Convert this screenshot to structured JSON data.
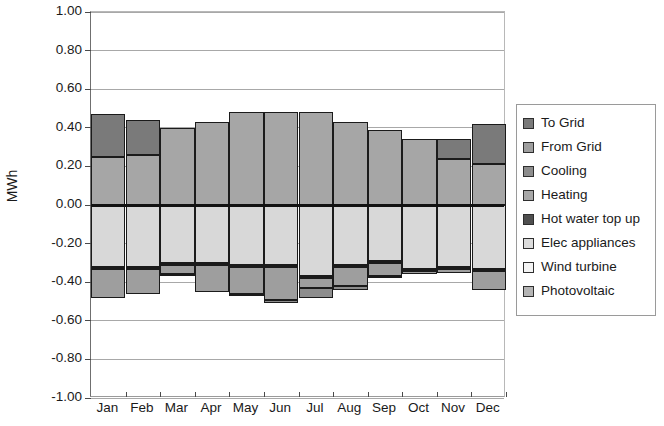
{
  "chart_data": {
    "type": "bar",
    "stacked": true,
    "title": "",
    "xlabel": "",
    "ylabel": "MWh",
    "ylim": [
      -1.0,
      1.0
    ],
    "ytick_step": 0.2,
    "grid": true,
    "legend_position": "right",
    "categories": [
      "Jan",
      "Feb",
      "Mar",
      "Apr",
      "May",
      "Jun",
      "Jul",
      "Aug",
      "Sep",
      "Oct",
      "Nov",
      "Dec"
    ],
    "ytick_labels": [
      "1.00",
      "0.80",
      "0.60",
      "0.40",
      "0.20",
      "0.00",
      "-0.20",
      "-0.40",
      "-0.60",
      "-0.80",
      "-1.00"
    ],
    "ytick_values": [
      1.0,
      0.8,
      0.6,
      0.4,
      0.2,
      0.0,
      -0.2,
      -0.4,
      -0.6,
      -0.8,
      -1.0
    ],
    "series": [
      {
        "name": "To Grid",
        "color": "#7a7a7a",
        "values": [
          0.22,
          0.18,
          0.0,
          0.0,
          0.0,
          0.0,
          0.0,
          0.0,
          0.0,
          0.0,
          0.1,
          0.21
        ]
      },
      {
        "name": "From Grid",
        "color": "#a6a6a6",
        "values": [
          0.25,
          0.26,
          0.4,
          0.43,
          0.48,
          0.48,
          0.48,
          0.43,
          0.39,
          0.34,
          0.24,
          0.21
        ]
      },
      {
        "name": "Cooling",
        "color": "#8d8d8d",
        "values": [
          0.0,
          0.0,
          -0.01,
          0.0,
          -0.01,
          -0.02,
          -0.05,
          -0.02,
          -0.01,
          0.0,
          0.0,
          0.0
        ]
      },
      {
        "name": "Heating",
        "color": "#9e9e9e",
        "values": [
          -0.15,
          -0.13,
          -0.05,
          -0.14,
          -0.14,
          -0.17,
          -0.05,
          -0.1,
          -0.07,
          -0.02,
          -0.02,
          -0.1
        ]
      },
      {
        "name": "Hot water top up",
        "color": "#5c5c5c",
        "values": [
          -0.01,
          -0.01,
          -0.01,
          -0.01,
          -0.01,
          -0.01,
          -0.01,
          -0.01,
          -0.01,
          -0.01,
          -0.01,
          -0.01
        ]
      },
      {
        "name": "Elec appliances",
        "color": "#d8d8d8",
        "values": [
          -0.32,
          -0.32,
          -0.3,
          -0.3,
          -0.31,
          -0.31,
          -0.37,
          -0.31,
          -0.29,
          -0.33,
          -0.32,
          -0.33
        ]
      },
      {
        "name": "Wind turbine",
        "color": "#f0f0f0",
        "values": [
          0.0,
          0.0,
          0.0,
          0.0,
          0.0,
          0.0,
          0.0,
          0.0,
          0.0,
          0.0,
          0.0,
          0.0
        ]
      },
      {
        "name": "Photovoltaic",
        "color": "#bdbdbd",
        "values": [
          0.0,
          0.0,
          0.0,
          0.0,
          0.0,
          0.0,
          0.0,
          0.0,
          0.0,
          0.0,
          0.0,
          0.0
        ]
      }
    ],
    "positive_stack_tops": [
      0.47,
      0.44,
      0.4,
      0.43,
      0.48,
      0.48,
      0.48,
      0.43,
      0.39,
      0.34,
      0.34,
      0.42
    ],
    "negative_stack_bottoms": [
      -0.48,
      -0.46,
      -0.37,
      -0.45,
      -0.47,
      -0.51,
      -0.48,
      -0.44,
      -0.38,
      -0.36,
      -0.35,
      -0.44
    ]
  },
  "legend": {
    "items": [
      {
        "label": "To Grid",
        "color": "#7a7a7a"
      },
      {
        "label": "From Grid",
        "color": "#9e9e9e"
      },
      {
        "label": "Cooling",
        "color": "#8d8d8d"
      },
      {
        "label": "Heating",
        "color": "#a8a8a8"
      },
      {
        "label": "Hot water top up",
        "color": "#4f4f4f"
      },
      {
        "label": "Elec appliances",
        "color": "#dcdcdc"
      },
      {
        "label": "Wind turbine",
        "color": "#f4f4f4"
      },
      {
        "label": "Photovoltaic",
        "color": "#b5b5b5"
      }
    ]
  }
}
